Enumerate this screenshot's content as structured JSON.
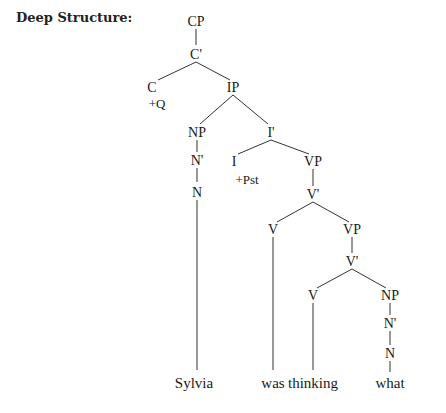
{
  "title": "Deep Structure:",
  "nodes": {
    "cp": "CP",
    "c_bar": "C'",
    "c": "C",
    "c_feature": "+Q",
    "ip": "IP",
    "np_subj": "NP",
    "n_bar_subj": "N'",
    "n_subj": "N",
    "i_bar": "I'",
    "i": "I",
    "i_feature": "+Pst",
    "vp1": "VP",
    "v_bar1": "V'",
    "v1": "V",
    "vp2": "VP",
    "v_bar2": "V'",
    "v2": "V",
    "np_obj": "NP",
    "n_bar_obj": "N'",
    "n_obj": "N"
  },
  "leaves": {
    "sylvia": "Sylvia",
    "was": "was",
    "thinking": "thinking",
    "what": "what"
  }
}
